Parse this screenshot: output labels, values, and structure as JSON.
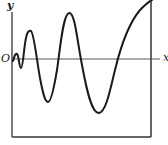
{
  "figure": {
    "labels": {
      "y_axis": "y",
      "origin": "O",
      "x_axis": "x"
    },
    "caption": "",
    "colors": {
      "stroke": "#1a1a1a",
      "axis": "#333333",
      "background": "#ffffff"
    },
    "curve": {
      "description": "Oscillating curve with growing amplitude and increasing period, starting at origin",
      "extrema": [
        {
          "type": "max",
          "x": 17,
          "y": 55
        },
        {
          "type": "min",
          "x": 21,
          "y": 68
        },
        {
          "type": "max",
          "x": 30,
          "y": 31
        },
        {
          "type": "min",
          "x": 48,
          "y": 102
        },
        {
          "type": "max",
          "x": 69,
          "y": 13
        },
        {
          "type": "min",
          "x": 99,
          "y": 113
        }
      ]
    }
  }
}
